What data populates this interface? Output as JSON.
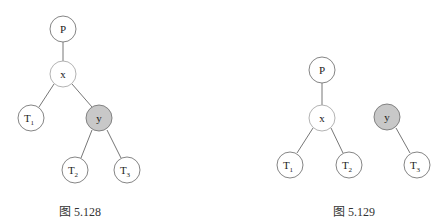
{
  "figures": [
    {
      "caption": "图 5.128",
      "nodes": {
        "P": {
          "label": "P",
          "fill": "#ffffff"
        },
        "x": {
          "label": "x",
          "fill": "#ffffff"
        },
        "T1": {
          "label": "T",
          "sub": "1",
          "fill": "#ffffff"
        },
        "y": {
          "label": "y",
          "fill": "#c8c8c8"
        },
        "T2": {
          "label": "T",
          "sub": "2",
          "fill": "#ffffff"
        },
        "T3": {
          "label": "T",
          "sub": "3",
          "fill": "#ffffff"
        }
      },
      "edges": [
        [
          "P",
          "x"
        ],
        [
          "x",
          "T1"
        ],
        [
          "x",
          "y"
        ],
        [
          "y",
          "T2"
        ],
        [
          "y",
          "T3"
        ]
      ]
    },
    {
      "caption": "图 5.129",
      "nodes": {
        "P": {
          "label": "P",
          "fill": "#ffffff"
        },
        "x": {
          "label": "x",
          "fill": "#ffffff"
        },
        "T1": {
          "label": "T",
          "sub": "1",
          "fill": "#ffffff"
        },
        "T2": {
          "label": "T",
          "sub": "2",
          "fill": "#ffffff"
        },
        "y": {
          "label": "y",
          "fill": "#c8c8c8"
        },
        "T3": {
          "label": "T",
          "sub": "3",
          "fill": "#ffffff"
        }
      },
      "edges": [
        [
          "P",
          "x"
        ],
        [
          "x",
          "T1"
        ],
        [
          "x",
          "T2"
        ],
        [
          "y",
          "T3"
        ]
      ]
    }
  ]
}
